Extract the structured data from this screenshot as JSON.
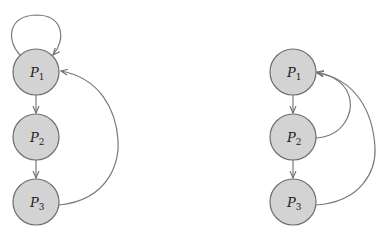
{
  "diagram": {
    "type": "directed-graph",
    "colors": {
      "node_fill": "#d3d3d3",
      "node_stroke": "#6e6e6e",
      "edge": "#7a7a7a",
      "background": "#ffffff"
    },
    "graphs": [
      {
        "id": "left",
        "nodes": [
          {
            "id": "P1",
            "label": "P",
            "sub": "1"
          },
          {
            "id": "P2",
            "label": "P",
            "sub": "2"
          },
          {
            "id": "P3",
            "label": "P",
            "sub": "3"
          }
        ],
        "edges": [
          {
            "from": "P1",
            "to": "P1",
            "kind": "self-loop"
          },
          {
            "from": "P1",
            "to": "P2"
          },
          {
            "from": "P2",
            "to": "P3"
          },
          {
            "from": "P3",
            "to": "P1",
            "kind": "curved"
          }
        ]
      },
      {
        "id": "right",
        "nodes": [
          {
            "id": "P1",
            "label": "P",
            "sub": "1"
          },
          {
            "id": "P2",
            "label": "P",
            "sub": "2"
          },
          {
            "id": "P3",
            "label": "P",
            "sub": "3"
          }
        ],
        "edges": [
          {
            "from": "P1",
            "to": "P2"
          },
          {
            "from": "P2",
            "to": "P3"
          },
          {
            "from": "P2",
            "to": "P1",
            "kind": "curved"
          },
          {
            "from": "P3",
            "to": "P1",
            "kind": "curved"
          }
        ]
      }
    ]
  }
}
